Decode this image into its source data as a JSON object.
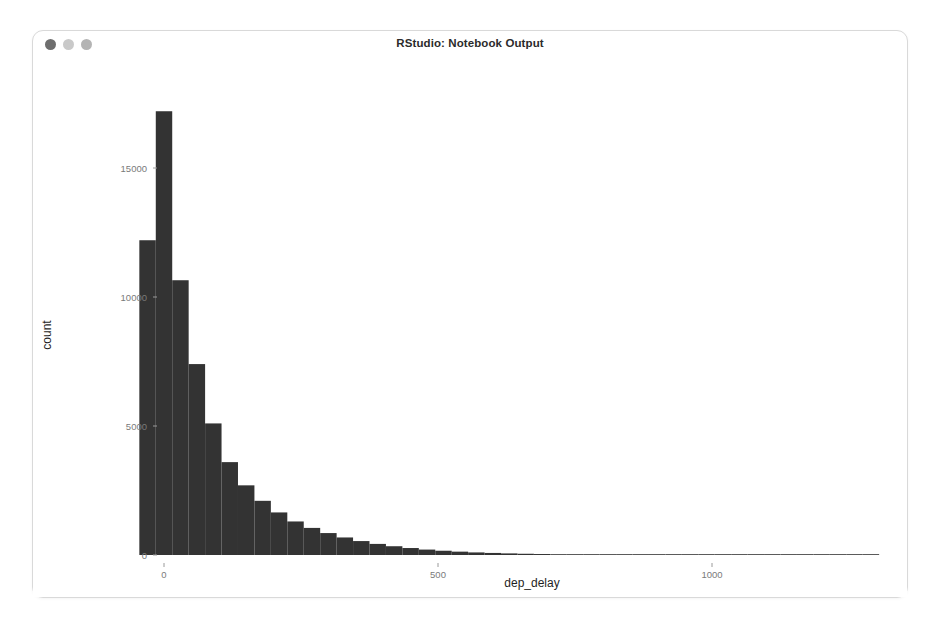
{
  "window": {
    "title": "RStudio: Notebook Output",
    "traffic_lights": [
      {
        "name": "close",
        "color": "#6e6e6e"
      },
      {
        "name": "minimize",
        "color": "#c9c9c9"
      },
      {
        "name": "zoom",
        "color": "#b4b4b4"
      }
    ],
    "background": "#ffffff",
    "border_color": "#d9d9d9"
  },
  "chart_data": {
    "type": "bar",
    "title": "",
    "subtitle": "",
    "xlabel": "dep_delay",
    "ylabel": "count",
    "xlim": [
      -60,
      1380
    ],
    "ylim": [
      0,
      17500
    ],
    "xticks": [
      0,
      500,
      1000
    ],
    "xtick_labels": [
      "0",
      "500",
      "1000"
    ],
    "yticks": [
      0,
      5000,
      10000,
      15000
    ],
    "ytick_labels": [
      "0",
      "5000",
      "10000",
      "15000"
    ],
    "grid": false,
    "legend": false,
    "bar_color": "#333333",
    "binwidth": 30,
    "bin_starts": [
      -45,
      -15,
      15,
      45,
      75,
      105,
      135,
      165,
      195,
      225,
      255,
      285,
      315,
      345,
      375,
      405,
      435,
      465,
      495,
      525,
      555,
      585,
      615,
      645,
      675,
      705,
      735,
      765,
      795,
      825,
      855,
      885,
      915,
      945,
      975,
      1005,
      1035,
      1065,
      1095,
      1125,
      1155,
      1185,
      1215,
      1245,
      1275
    ],
    "categories": [
      "-45",
      "-15",
      "15",
      "45",
      "75",
      "105",
      "135",
      "165",
      "195",
      "225",
      "255",
      "285",
      "315",
      "345",
      "375",
      "405",
      "435",
      "465",
      "495",
      "525",
      "555",
      "585",
      "615",
      "645",
      "675",
      "705",
      "735",
      "765",
      "795",
      "825",
      "855",
      "885",
      "915",
      "945",
      "975",
      "1005",
      "1035",
      "1065",
      "1095",
      "1125",
      "1155",
      "1185",
      "1215",
      "1245",
      "1275"
    ],
    "values": [
      12200,
      17200,
      10650,
      7400,
      5100,
      3600,
      2700,
      2100,
      1650,
      1300,
      1050,
      850,
      680,
      540,
      430,
      340,
      270,
      210,
      165,
      130,
      100,
      80,
      62,
      48,
      38,
      30,
      24,
      18,
      14,
      11,
      9,
      7,
      6,
      5,
      4,
      3,
      3,
      2,
      2,
      2,
      1,
      1,
      1,
      1,
      1
    ]
  },
  "layout": {
    "plot_left": 125,
    "plot_right": 874,
    "plot_top": 55,
    "plot_bottom": 496,
    "x_zero_px": 131,
    "x_500_px": 405,
    "x_1000_px": 683
  }
}
